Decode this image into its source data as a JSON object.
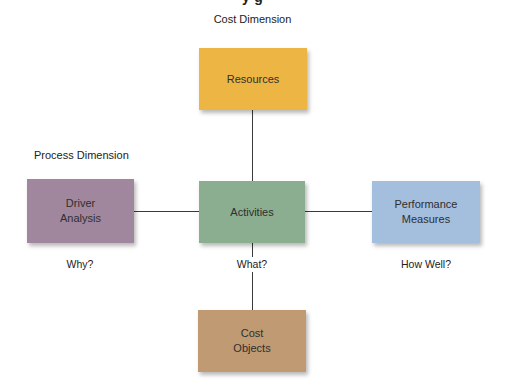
{
  "diagram": {
    "dimension_labels": {
      "cost": "Cost Dimension",
      "process": "Process Dimension"
    },
    "nodes": {
      "resources": {
        "label": "Resources",
        "color": "#EDB544"
      },
      "driver_analysis": {
        "line1": "Driver",
        "line2": "Analysis",
        "color": "#A1879E"
      },
      "activities": {
        "label": "Activities",
        "color": "#8BAD90"
      },
      "performance_measures": {
        "line1": "Performance",
        "line2": "Measures",
        "color": "#A4BEDD"
      },
      "cost_objects": {
        "line1": "Cost",
        "line2": "Objects",
        "color": "#BF9A72"
      }
    },
    "questions": {
      "why": "Why?",
      "what": "What?",
      "how_well": "How Well?"
    },
    "edges": [
      {
        "from": "resources",
        "to": "activities"
      },
      {
        "from": "driver_analysis",
        "to": "activities"
      },
      {
        "from": "activities",
        "to": "performance_measures"
      },
      {
        "from": "activities",
        "to": "cost_objects"
      }
    ]
  }
}
